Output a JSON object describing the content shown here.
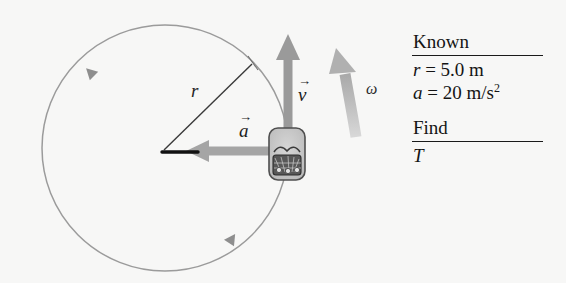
{
  "diagram": {
    "title_internal": "uniform-circular-motion-problem-setup",
    "background_color": "#f7f7f6",
    "circle": {
      "center_x": 165,
      "center_y": 148,
      "radius": 123,
      "stroke_color": "#9b9b9b",
      "direction": "counterclockwise"
    },
    "radius_line": {
      "label": "r",
      "label_x": 191,
      "label_y": 88,
      "stroke_color": "#3a3a3a"
    },
    "velocity_vector": {
      "label": "v",
      "overbar": "→",
      "label_x": 299,
      "label_y": 85,
      "color": "#9a9a9a",
      "direction": "up"
    },
    "acceleration_vector": {
      "label": "a",
      "overbar": "→",
      "label_x": 240,
      "label_y": 121,
      "color": "#a5a5a5",
      "direction": "left"
    },
    "angular_velocity": {
      "label": "ω",
      "label_x": 367,
      "label_y": 88,
      "color": "#b4b4b4",
      "direction": "counterclockwise"
    },
    "object": {
      "name": "car",
      "x": 269,
      "y": 128,
      "width": 36,
      "height": 52,
      "body_color": "#c9c9c9",
      "outline_color": "#4a4a4a"
    }
  },
  "panel": {
    "known_heading": "Known",
    "known_rows": [
      {
        "symbol": "r",
        "eq": " = 5.0 m",
        "sup": ""
      },
      {
        "symbol": "a",
        "eq": " = 20 m/s",
        "sup": "2"
      }
    ],
    "find_heading": "Find",
    "find_symbol": "T"
  }
}
